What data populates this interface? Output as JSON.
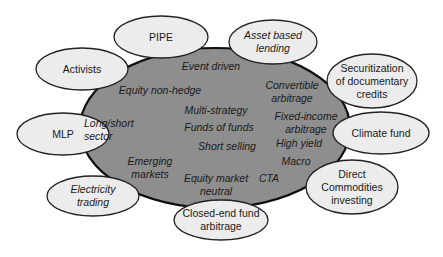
{
  "colors": {
    "core_fill": "#8e8e8e",
    "core_stroke": "#111111",
    "satellite_fill": "#ececec",
    "satellite_stroke": "#222222",
    "text": "#1a1a1a",
    "background": "#ffffff"
  },
  "core": {
    "name": "hedge-fund-strategies",
    "cx": 215,
    "cy": 128,
    "rx": 135,
    "ry": 80,
    "items": [
      {
        "label": "Event driven",
        "x": 211,
        "y": 66
      },
      {
        "label": "Equity non-hedge",
        "x": 160,
        "y": 90
      },
      {
        "label": "Convertible\narbitrage",
        "x": 292,
        "y": 92
      },
      {
        "label": "Multi-strategy",
        "x": 216,
        "y": 110
      },
      {
        "label": "Fixed-income\narbitrage",
        "x": 306,
        "y": 123
      },
      {
        "label": "Long/short\nsector",
        "x": 114,
        "y": 130
      },
      {
        "label": "Funds of funds",
        "x": 219,
        "y": 127
      },
      {
        "label": "Short selling",
        "x": 227,
        "y": 146
      },
      {
        "label": "High yield",
        "x": 299,
        "y": 143
      },
      {
        "label": "Emerging\nmarkets",
        "x": 150,
        "y": 168
      },
      {
        "label": "Macro",
        "x": 296,
        "y": 161
      },
      {
        "label": "CTA",
        "x": 269,
        "y": 178
      },
      {
        "label": "Equity market\nneutral",
        "x": 216,
        "y": 185
      }
    ]
  },
  "satellites": [
    {
      "id": "pipe",
      "label": "PIPE",
      "italic": false,
      "cx": 161,
      "cy": 37,
      "rx": 47,
      "ry": 21
    },
    {
      "id": "asset-based-lending",
      "label": "Asset based\nlending",
      "italic": true,
      "cx": 273,
      "cy": 42,
      "rx": 44,
      "ry": 22
    },
    {
      "id": "activists",
      "label": "Activists",
      "italic": false,
      "cx": 82,
      "cy": 69,
      "rx": 46,
      "ry": 21
    },
    {
      "id": "securitization",
      "label": "Securitization\nof documentary\ncredits",
      "italic": false,
      "cx": 372,
      "cy": 81,
      "rx": 45,
      "ry": 27
    },
    {
      "id": "mlp",
      "label": "MLP",
      "italic": false,
      "cx": 63,
      "cy": 134,
      "rx": 46,
      "ry": 21
    },
    {
      "id": "climate-fund",
      "label": "Climate fund",
      "italic": false,
      "cx": 381,
      "cy": 133,
      "rx": 48,
      "ry": 21
    },
    {
      "id": "electricity-trading",
      "label": "Electricity\ntrading",
      "italic": true,
      "cx": 93,
      "cy": 196,
      "rx": 46,
      "ry": 20
    },
    {
      "id": "direct-commodities",
      "label": "Direct\nCommodities\ninvesting",
      "italic": false,
      "cx": 352,
      "cy": 187,
      "rx": 46,
      "ry": 27
    },
    {
      "id": "closed-end-fund",
      "label": "Closed-end fund\narbitrage",
      "italic": false,
      "cx": 221,
      "cy": 220,
      "rx": 47,
      "ry": 20
    }
  ]
}
